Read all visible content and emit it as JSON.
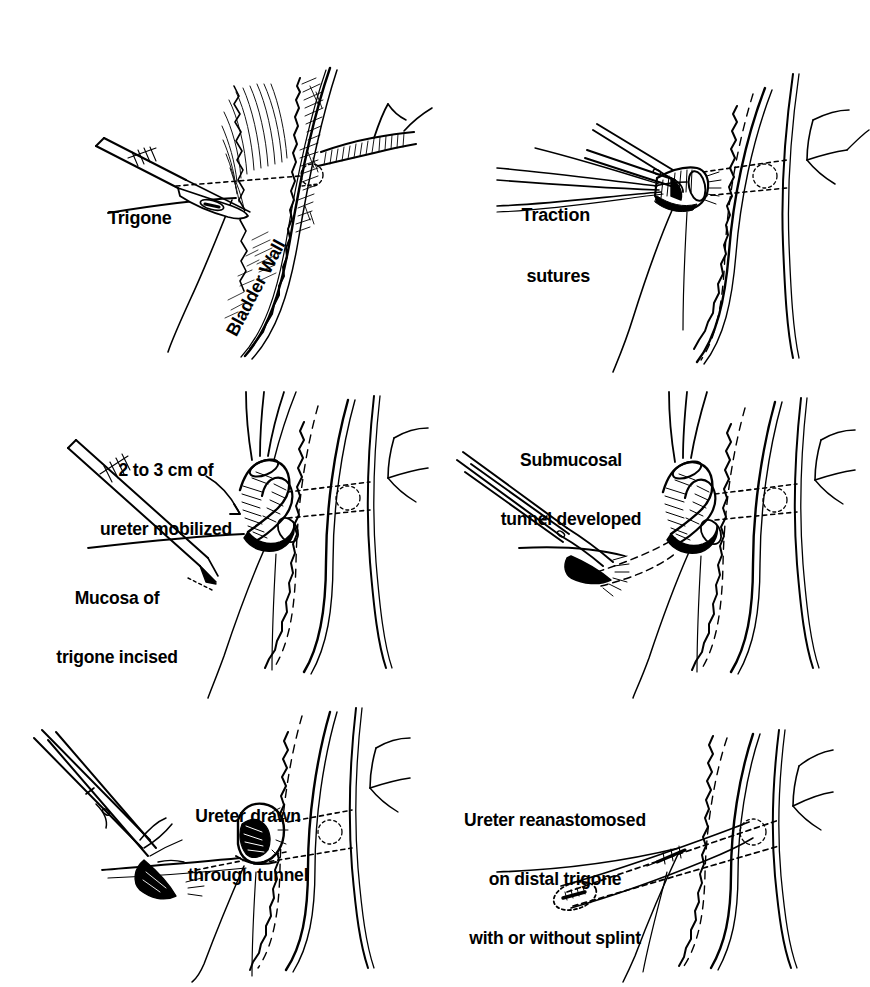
{
  "figure": {
    "background_color": "#ffffff",
    "ink_color": "#000000",
    "panel_count": 6
  },
  "panels": [
    {
      "id": "panel-1",
      "index": "1",
      "name": "trigone-incision",
      "labels": [
        {
          "id": "trigone",
          "text": "Trigone",
          "lines": [
            "Trigone"
          ],
          "align": "left",
          "rotated": false
        },
        {
          "id": "bladder-wall",
          "text": "Bladder Wall",
          "lines": [
            "Bladder Wall"
          ],
          "align": "left",
          "rotated": true,
          "rotation_deg": -62
        }
      ],
      "instruments": [
        "scalpel"
      ],
      "anatomy": [
        "trigone",
        "bladder-wall",
        "ureter",
        "mucosa-hatching"
      ]
    },
    {
      "id": "panel-2",
      "index": "2",
      "name": "traction-sutures",
      "labels": [
        {
          "id": "traction-sutures",
          "text": "Traction sutures",
          "lines": [
            "Traction",
            "sutures"
          ],
          "align": "right",
          "rotated": false
        }
      ],
      "instruments": [
        "forceps",
        "sutures"
      ],
      "anatomy": [
        "ureteral-stump",
        "bladder-wall",
        "ureteral-orifice"
      ]
    },
    {
      "id": "panel-3",
      "index": "3",
      "name": "ureter-mobilized",
      "labels": [
        {
          "id": "ureter-mobilized",
          "text": "2 to 3 cm of ureter mobilized",
          "lines": [
            "2 to 3 cm of",
            "ureter mobilized"
          ],
          "align": "center",
          "rotated": false
        },
        {
          "id": "mucosa-incised",
          "text": "Mucosa of trigone incised",
          "lines": [
            "Mucosa of",
            "trigone incised"
          ],
          "align": "center",
          "rotated": false
        }
      ],
      "instruments": [
        "scalpel",
        "traction-sutures"
      ],
      "anatomy": [
        "mobilized-ureter",
        "bladder-wall",
        "trigone-mucosa"
      ]
    },
    {
      "id": "panel-4",
      "index": "4",
      "name": "submucosal-tunnel",
      "labels": [
        {
          "id": "submucosal-tunnel",
          "text": "Submucosal tunnel developed",
          "lines": [
            "Submucosal",
            "tunnel developed"
          ],
          "align": "center",
          "rotated": false
        }
      ],
      "instruments": [
        "scissors",
        "traction-sutures"
      ],
      "anatomy": [
        "submucosal-tunnel",
        "mobilized-ureter",
        "bladder-wall"
      ]
    },
    {
      "id": "panel-5",
      "index": "5",
      "name": "ureter-through-tunnel",
      "labels": [
        {
          "id": "ureter-drawn",
          "text": "Ureter drawn through tunnel",
          "lines": [
            "Ureter drawn",
            "through tunnel"
          ],
          "align": "center",
          "rotated": false
        }
      ],
      "instruments": [
        "clamp",
        "sutures"
      ],
      "anatomy": [
        "ureteral-stump",
        "submucosal-tunnel",
        "bladder-wall"
      ]
    },
    {
      "id": "panel-6",
      "index": "6",
      "name": "reanastomosis",
      "labels": [
        {
          "id": "ureter-reanastomosed",
          "text": "Ureter reanastomosed on distal trigone with or without splint",
          "lines": [
            "Ureter reanastomosed",
            "on distal trigone",
            "with or without splint"
          ],
          "align": "center",
          "rotated": false
        }
      ],
      "instruments": [
        "splint"
      ],
      "anatomy": [
        "reimplanted-ureter",
        "distal-trigone",
        "bladder-wall",
        "tunnel-path"
      ]
    }
  ]
}
